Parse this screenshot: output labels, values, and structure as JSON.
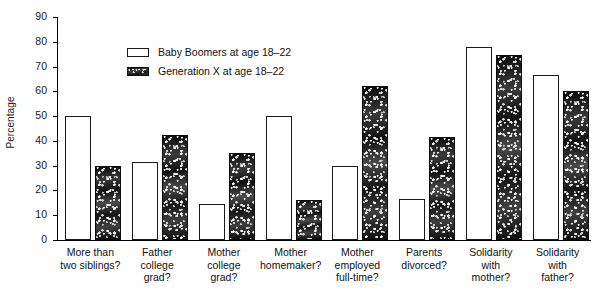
{
  "chart_data": {
    "type": "bar",
    "title": "",
    "xlabel": "",
    "ylabel": "Percentage",
    "ylim": [
      0,
      90
    ],
    "yticks": [
      0,
      10,
      20,
      30,
      40,
      50,
      60,
      70,
      80,
      90
    ],
    "grid": false,
    "legend_position": "upper-left-inside",
    "categories": [
      "More than two siblings?",
      "Father college grad?",
      "Mother college grad?",
      "Mother homemaker?",
      "Mother employed full-time?",
      "Parents divorced?",
      "Solidarity with mother?",
      "Solidarity with father?"
    ],
    "category_lines": [
      [
        "More than",
        "two siblings?"
      ],
      [
        "Father",
        "college",
        "grad?"
      ],
      [
        "Mother",
        "college",
        "grad?"
      ],
      [
        "Mother",
        "homemaker?"
      ],
      [
        "Mother",
        "employed",
        "full-time?"
      ],
      [
        "Parents",
        "divorced?"
      ],
      [
        "Solidarity",
        "with",
        "mother?"
      ],
      [
        "Solidarity",
        "with",
        "father?"
      ]
    ],
    "series": [
      {
        "name": "Baby Boomers at age 18–22",
        "values": [
          50,
          31.5,
          14.5,
          50,
          30,
          16.5,
          78,
          66.5
        ]
      },
      {
        "name": "Generation X at age 18–22",
        "values": [
          30,
          42.5,
          35,
          16,
          62,
          41.5,
          74.5,
          60
        ]
      }
    ]
  },
  "legend": {
    "entries": [
      {
        "label": "Baby Boomers at age 18–22",
        "swatch": "open-white-box"
      },
      {
        "label": "Generation X at age 18–22",
        "swatch": "dark-speckled-box"
      }
    ]
  },
  "axis": {
    "y_title": "Percentage",
    "y_tick_labels": [
      "90",
      "80",
      "70",
      "60",
      "50",
      "40",
      "30",
      "20",
      "10",
      "0"
    ]
  },
  "colors": {
    "axis": "#000000",
    "text": "#111111",
    "boomer_fill": "#ffffff",
    "boomer_stroke": "#1a1a1a",
    "genx_fill": "#2b2b2b",
    "background": "#ffffff"
  }
}
